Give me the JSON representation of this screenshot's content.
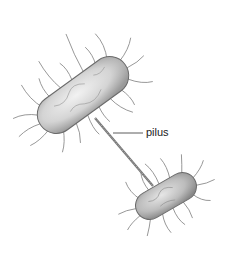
{
  "diagram": {
    "labels": [
      {
        "text": "pilus",
        "target": "pilus"
      }
    ],
    "elements": [
      {
        "name": "donor-bacterium",
        "shape": "rod"
      },
      {
        "name": "recipient-bacterium",
        "shape": "rod"
      },
      {
        "name": "pilus",
        "shape": "strand"
      }
    ],
    "colors": {
      "body": "#cfcfcf",
      "outline": "#6a6a6a",
      "hairs": "#8a8a8a",
      "label": "#222222"
    }
  }
}
